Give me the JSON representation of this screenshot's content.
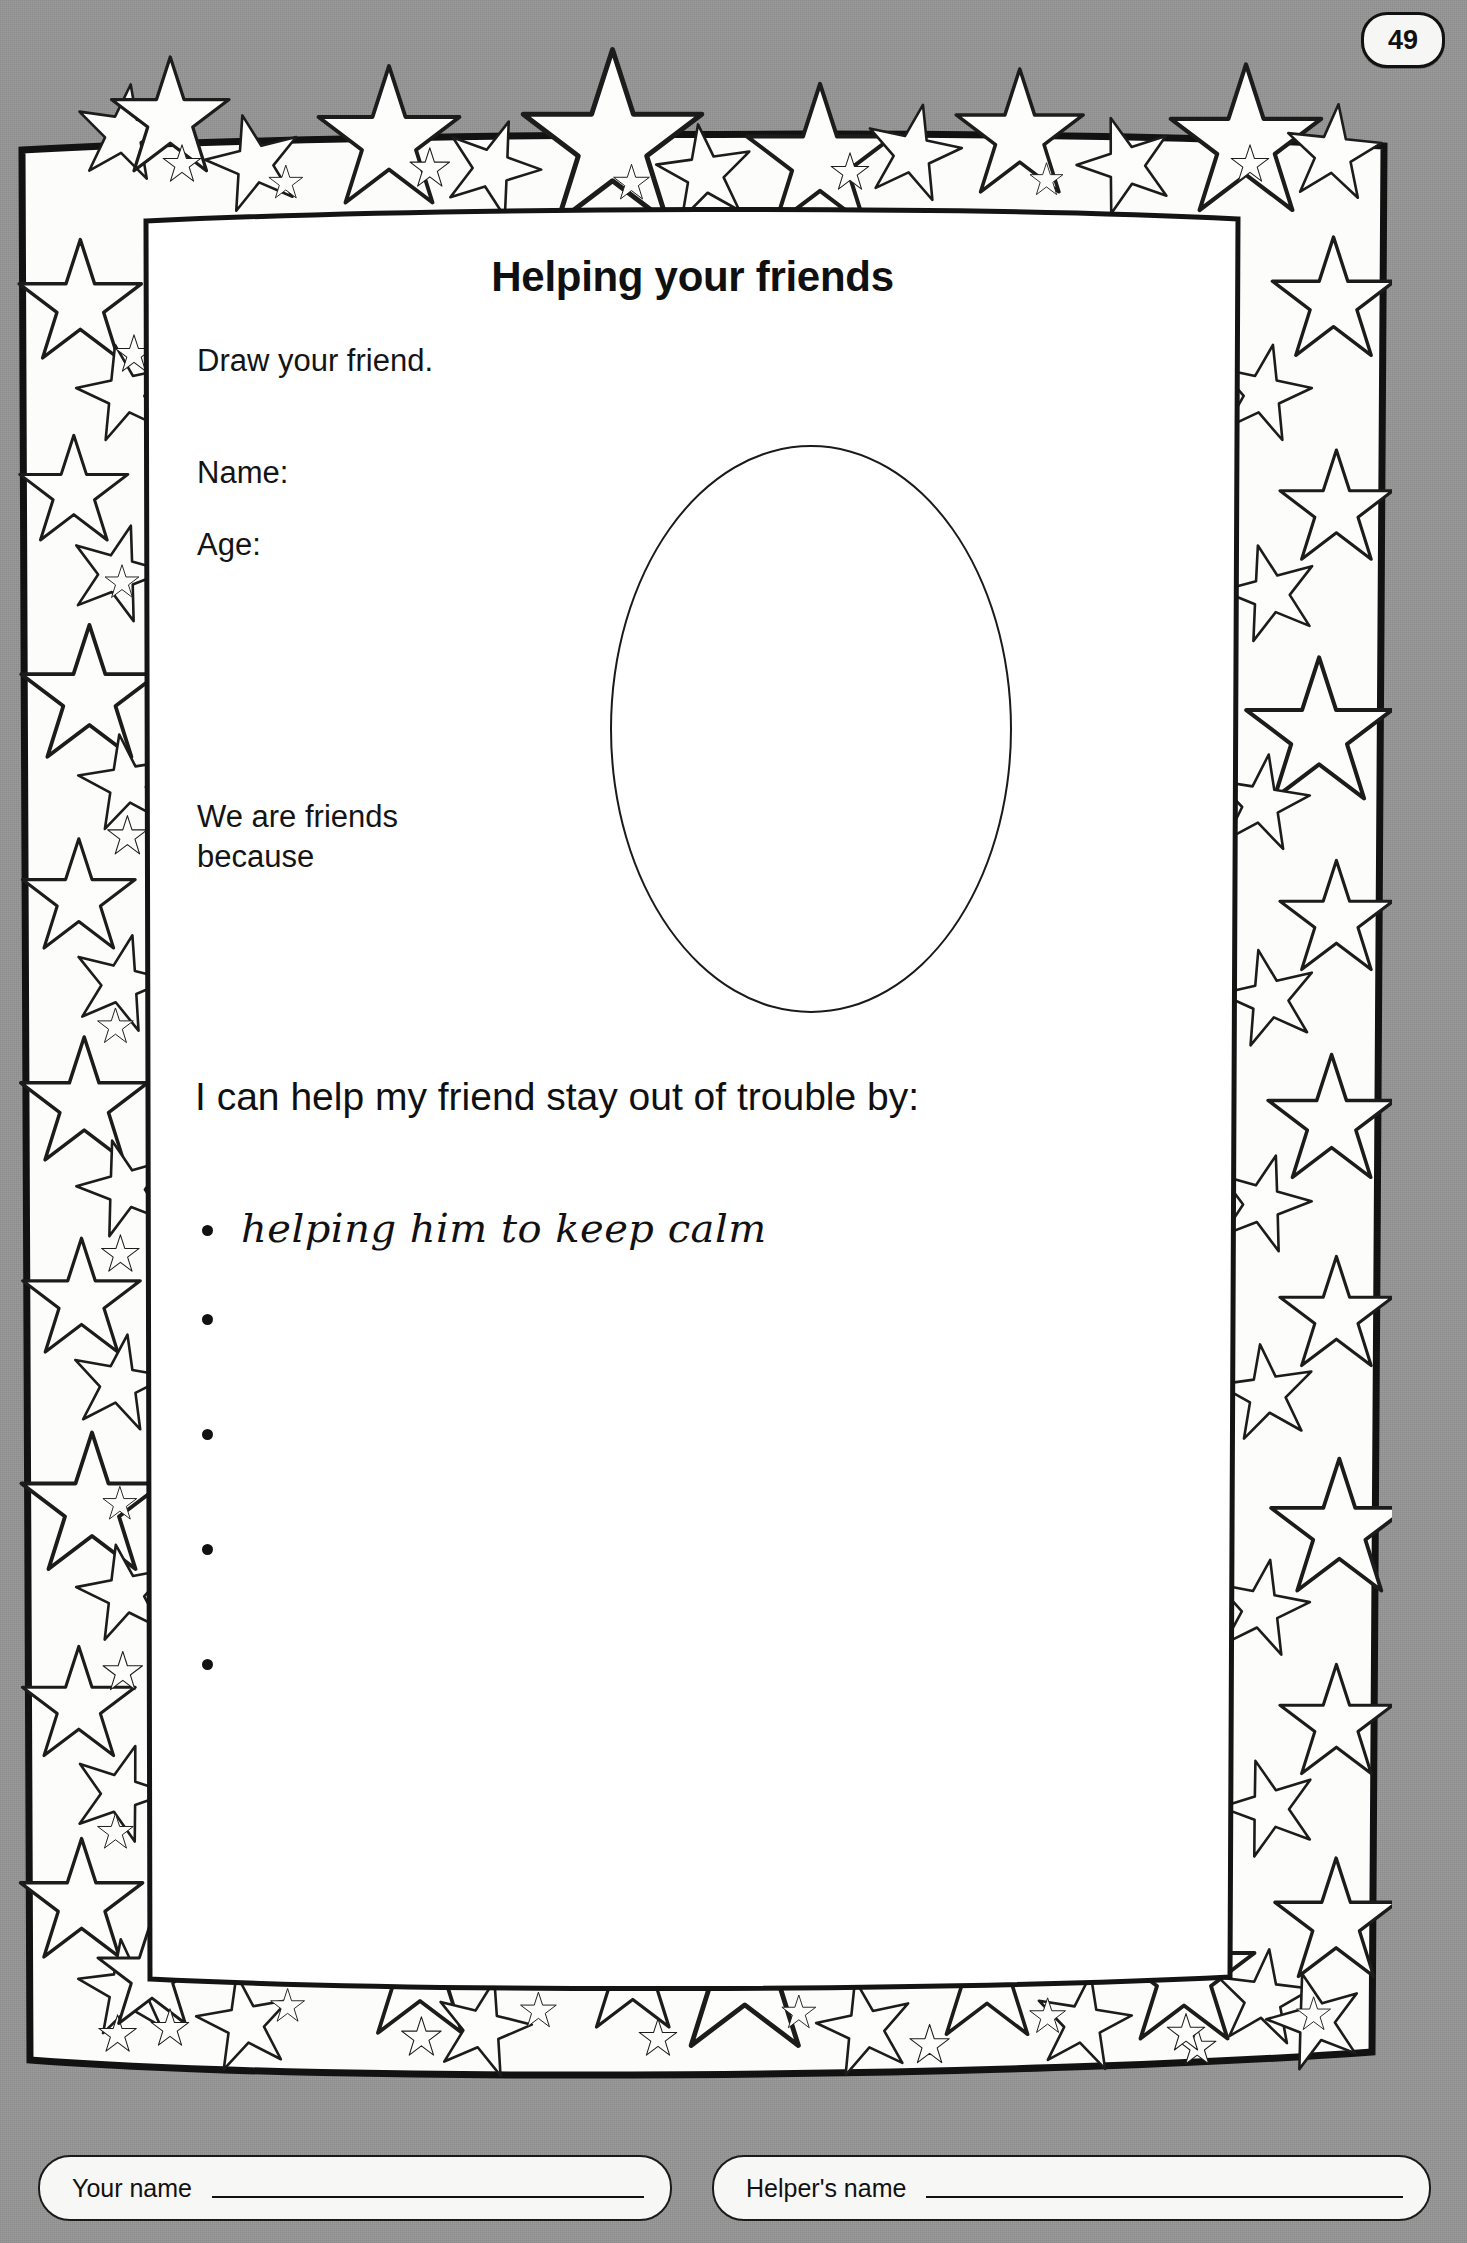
{
  "page": {
    "number": "49",
    "background_color": "#969696",
    "paper_color": "#ffffff"
  },
  "worksheet": {
    "title": "Helping your friends",
    "draw_instruction": "Draw your friend.",
    "fields": [
      {
        "label": "Name:",
        "value": ""
      },
      {
        "label": "Age:",
        "value": ""
      }
    ],
    "reason_label": "We are friends\nbecause",
    "drawing_area": {
      "shape": "oval",
      "name": "friend-portrait-oval"
    },
    "prompt": "I can help my friend stay out of trouble by:",
    "answers": [
      {
        "text": "helping him to keep calm",
        "handwritten": true
      },
      {
        "text": "",
        "handwritten": false
      },
      {
        "text": "",
        "handwritten": false
      },
      {
        "text": "",
        "handwritten": false
      },
      {
        "text": "",
        "handwritten": false
      }
    ]
  },
  "footer": {
    "your_name_label": "Your name",
    "your_name_value": "",
    "helpers_name_label": "Helper's name",
    "helpers_name_value": ""
  }
}
